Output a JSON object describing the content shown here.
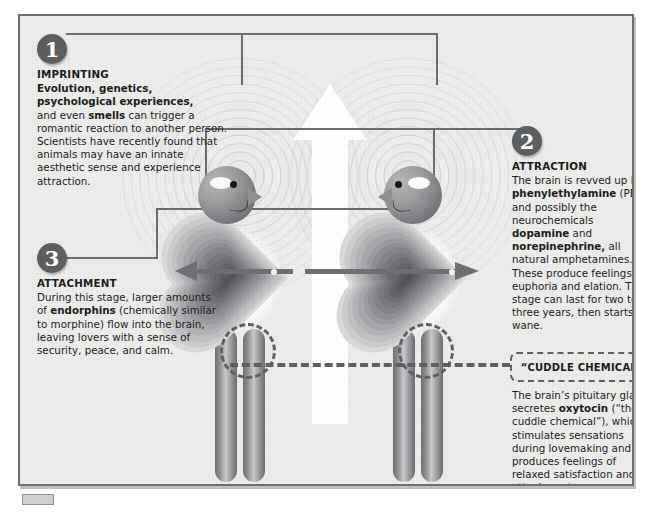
{
  "poster": {
    "title": "The Chemistry of Love",
    "frame_color": "#6d6f71",
    "background_color": "#ececeb",
    "accent_color": "#5c5e61"
  },
  "stages": [
    {
      "number": "1",
      "heading": "IMPRINTING",
      "body_html": "<b>Evolution, genetics,<br>psychological experiences,</b><br>and even <b>smells</b> can trigger a romantic reaction to another person. Scientists have recently found that animals may have an innate aesthetic sense and experience attraction."
    },
    {
      "number": "2",
      "heading": "ATTRACTION",
      "body_html": "The brain is revved up by <b>phenylethylamine</b> (PEA) and possibly the neurochemicals <b>dopamine</b> and <b>norepinephrine,</b> all natural amphetamines. These produce feelings of euphoria and elation. This stage can last for two to three years, then starts to wane."
    },
    {
      "number": "3",
      "heading": "ATTACHMENT",
      "body_html": "During this stage, larger amounts of <b>endorphins</b> (chemically similar to morphine) flow into the brain, leaving lovers with a sense of security, peace, and calm."
    }
  ],
  "callout": {
    "label": "“CUDDLE CHEMICAL”",
    "body_html": "The brain’s pituitary gland secretes <b>oxytocin</b> (“the cuddle chemical”), which stimulates sensations during lovemaking and produces feelings of relaxed satisfaction and attachment."
  },
  "figures": {
    "left_person": "person-facing-right",
    "right_person": "person-facing-left",
    "hearts": 2,
    "arrows": 2,
    "legs_pairs": 2,
    "up_arrow": "white-up-arrow"
  }
}
